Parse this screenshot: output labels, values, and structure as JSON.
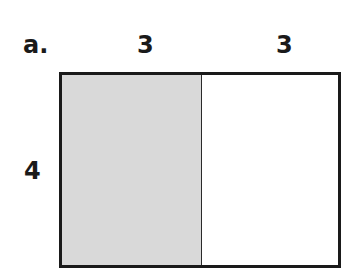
{
  "problem": {
    "label": "a.",
    "top_dims": [
      "3",
      "3"
    ],
    "side_dim": "4",
    "shaded_part": "left",
    "colors": {
      "shade": "#d9d9d9",
      "border": "#1a1a1a"
    }
  }
}
